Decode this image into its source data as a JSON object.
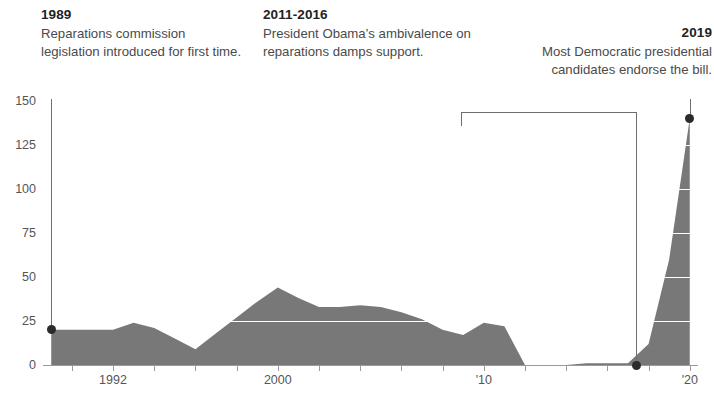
{
  "annotations": [
    {
      "id": "1989",
      "year": "1989",
      "text": "Reparations commission legislation introduced for first time.",
      "marker_value": 20,
      "marker_year": 1989
    },
    {
      "id": "2011-2016",
      "year": "2011-2016",
      "text": "President Obama’s ambivalence on reparations damps support.",
      "span_start_year": 2011,
      "span_end_year": 2016,
      "marker_value": 0
    },
    {
      "id": "2019",
      "year": "2019",
      "text": "Most Democratic presidential candidates endorse the bill.",
      "marker_value": 140,
      "marker_year": 2020
    }
  ],
  "colors": {
    "area_fill": "#787878",
    "gridline": "#ffffff",
    "axis": "#9a9a9a",
    "marker": "#2b2b2b",
    "connector": "#6e6e6e",
    "text": "#4a4a4a",
    "heading": "#222222"
  },
  "chart_data": {
    "type": "area",
    "title": "",
    "xlabel": "",
    "ylabel": "",
    "xlim": [
      1988.6,
      2020.4
    ],
    "ylim": [
      0,
      150
    ],
    "grid": true,
    "legend": false,
    "y_ticks": [
      0,
      25,
      50,
      75,
      100,
      125,
      150
    ],
    "y_tick_labels": [
      "0",
      "25",
      "50",
      "75",
      "100",
      "125",
      "150"
    ],
    "x_ticks": [
      1990,
      1992,
      1994,
      1996,
      1998,
      2000,
      2002,
      2004,
      2006,
      2008,
      2010,
      2012,
      2014,
      2016,
      2018,
      2020
    ],
    "x_tick_labels": [
      "",
      "1992",
      "",
      "",
      "",
      "2000",
      "",
      "",
      "",
      "",
      "'10",
      "",
      "",
      "",
      "",
      "'20"
    ],
    "x": [
      1989,
      1990,
      1991,
      1992,
      1993,
      1994,
      1995,
      1996,
      1997,
      1998,
      1999,
      2000,
      2001,
      2002,
      2003,
      2004,
      2005,
      2006,
      2007,
      2008,
      2009,
      2010,
      2011,
      2012,
      2013,
      2014,
      2015,
      2016,
      2017,
      2018,
      2019,
      2020
    ],
    "values": [
      20,
      20,
      20,
      20,
      24,
      21,
      15,
      9,
      18,
      27,
      36,
      44,
      38,
      33,
      33,
      34,
      33,
      30,
      26,
      20,
      17,
      24,
      22,
      0,
      0,
      0,
      1,
      1,
      1,
      12,
      60,
      140
    ],
    "series": [
      {
        "name": "Cosponsors of reparations bill",
        "values": [
          20,
          20,
          20,
          20,
          24,
          21,
          15,
          9,
          18,
          27,
          36,
          44,
          38,
          33,
          33,
          34,
          33,
          30,
          26,
          20,
          17,
          24,
          22,
          0,
          0,
          0,
          1,
          1,
          1,
          12,
          60,
          140
        ]
      }
    ]
  }
}
